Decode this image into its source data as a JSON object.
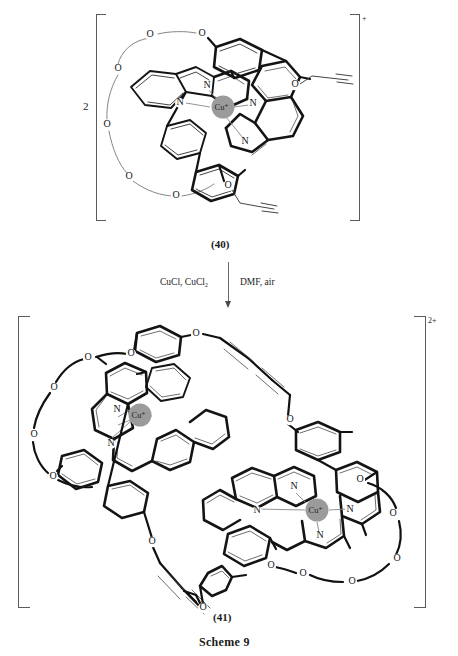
{
  "document": {
    "scheme_label": "Scheme 9",
    "background_color": "#ffffff",
    "ink_color": "#141414"
  },
  "reactant": {
    "coefficient": "2",
    "compound_label": "(40)",
    "charge": "+",
    "metal_label": "Cu",
    "metal_charge": "+",
    "metal_color": "#9b9b9b",
    "heteroatoms": {
      "nitrogen": "N",
      "oxygen": "O"
    },
    "nitrogen_count": 4,
    "oxygen_labels": [
      "O",
      "O",
      "O",
      "O",
      "O",
      "O",
      "O",
      "O"
    ],
    "terminal_groups": "propargyl ether"
  },
  "arrow": {
    "direction": "down",
    "reagents_left": "CuCl, CuCl₂",
    "reagents_right": "DMF, air"
  },
  "product": {
    "compound_label": "(41)",
    "charge": "2+",
    "metal_label": "Cu",
    "metal_charge": "+",
    "metal_color": "#9b9b9b",
    "metal_count": 2,
    "heteroatoms": {
      "nitrogen": "N",
      "oxygen": "O"
    },
    "linkage": "butadiyne",
    "linkage_count": 2
  },
  "atoms": {
    "reactant_oxygens": [
      {
        "x": 150,
        "y": 35
      },
      {
        "x": 200,
        "y": 34
      },
      {
        "x": 118,
        "y": 69
      },
      {
        "x": 108,
        "y": 125
      },
      {
        "x": 128,
        "y": 177
      },
      {
        "x": 176,
        "y": 196
      },
      {
        "x": 293,
        "y": 84
      },
      {
        "x": 228,
        "y": 185
      }
    ],
    "reactant_nitrogens": [
      {
        "x": 207,
        "y": 86
      },
      {
        "x": 180,
        "y": 103
      },
      {
        "x": 253,
        "y": 104
      },
      {
        "x": 245,
        "y": 142
      }
    ],
    "reactant_metal": {
      "x": 223,
      "y": 107
    },
    "product_left_metal": {
      "x": 140,
      "y": 415
    },
    "product_right_metal": {
      "x": 317,
      "y": 490
    }
  }
}
